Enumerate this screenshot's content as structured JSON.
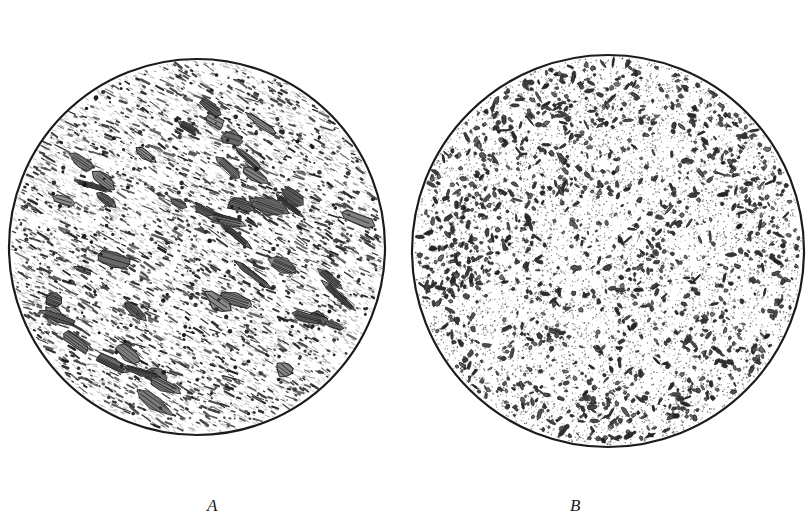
{
  "figure": {
    "type": "photomicrograph-plate",
    "panel_count": 2,
    "background_color": "#ffffff",
    "ink_color": "#1b1b1b"
  },
  "captions": {
    "panel_a_label": "A",
    "panel_b_label": "B"
  },
  "panels": [
    {
      "id": "A",
      "label": "A",
      "shape": "circle",
      "center_x": 197,
      "center_y": 247,
      "radius": 188,
      "outline_color": "#1b1b1b",
      "outline_width": 2.2,
      "texture": "elongated-aligned-particles",
      "grain_orientation_deg": 28,
      "matrix_color": "#ffffff",
      "particle_color": "#2a2a2a",
      "particle_count": 2100,
      "large_inclusion_count": 46,
      "stipple_count": 5200,
      "description": "Elongated dark particles strongly aligned along a single diagonal direction in a light matrix"
    },
    {
      "id": "B",
      "label": "B",
      "shape": "circle",
      "center_x": 608,
      "center_y": 251,
      "radius": 196,
      "outline_color": "#1b1b1b",
      "outline_width": 2.2,
      "texture": "randomly-oriented-particles",
      "grain_orientation_deg": 0,
      "matrix_color": "#ffffff",
      "particle_color": "#2a2a2a",
      "particle_count": 1450,
      "light_patch_count": 17,
      "stipple_count": 9000,
      "description": "Randomly oriented blocky dark particles distributed in networks around lighter stippled patches"
    }
  ],
  "geometry": {
    "canvas_width": 810,
    "canvas_height": 526,
    "overlap_top_x": 400,
    "overlap_top_y": 78,
    "overlap_bottom_x": 405,
    "overlap_bottom_y": 435,
    "panel_b_overlaps_panel_a": true
  }
}
